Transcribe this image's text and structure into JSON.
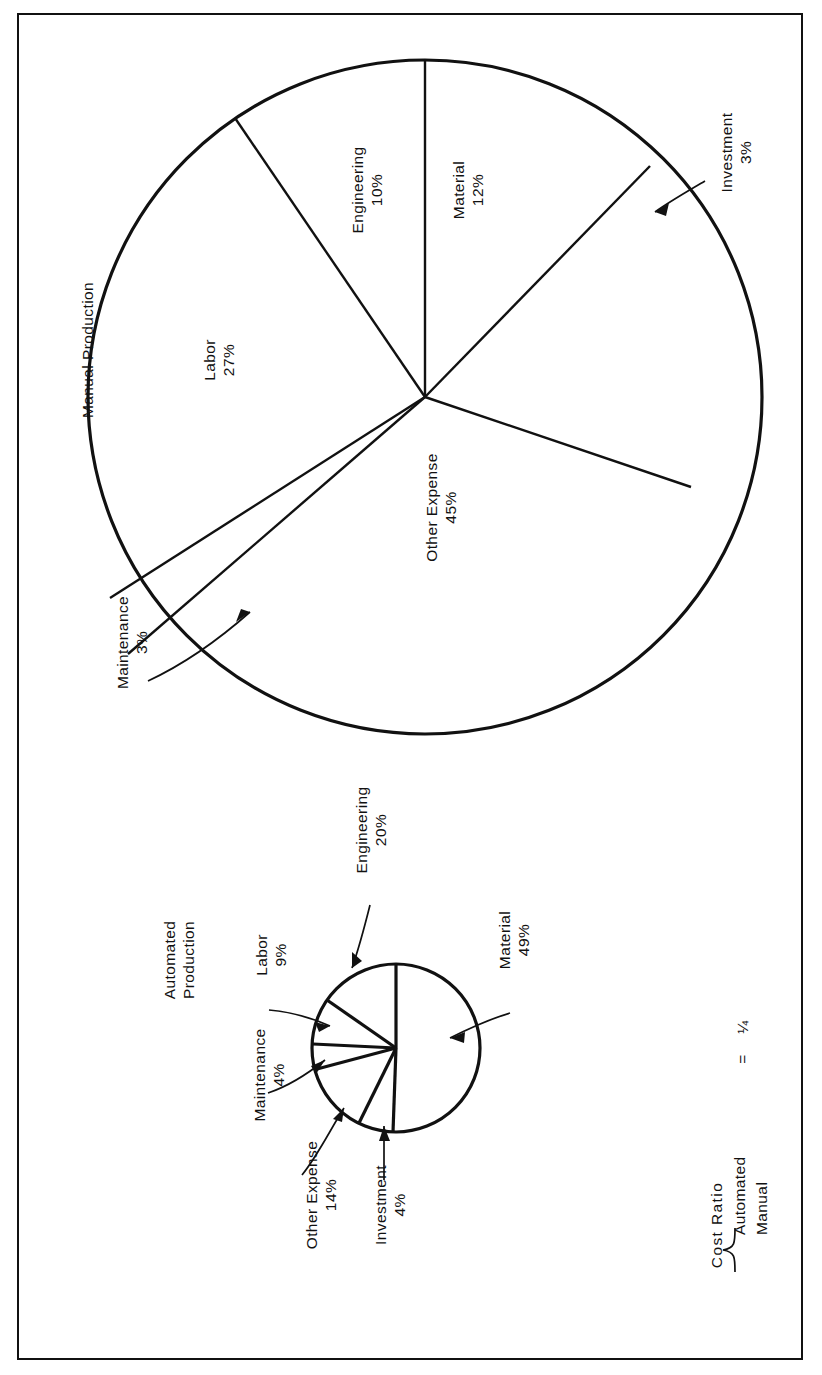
{
  "figure": {
    "orientation": "rotated-90-ccw",
    "border_color": "#111111",
    "background": "#ffffff"
  },
  "manual": {
    "title": "Manual Production",
    "labels": {
      "engineering": "Engineering\n10%",
      "material": "Material\n12%",
      "investment": "Investment\n3%",
      "other_expense": "Other Expense\n45%",
      "maintenance": "Maintenance\n3%",
      "labor": "Labor\n27%"
    }
  },
  "automated": {
    "title": "Automated\nProduction",
    "labels": {
      "engineering": "Engineering\n20%",
      "labor": "Labor\n9%",
      "maintenance": "Maintenance\n4%",
      "other_expense": "Other Expense\n14%",
      "investment": "Investment\n4%",
      "material": "Material\n49%"
    }
  },
  "cost_ratio": {
    "label": "Cost Ratio",
    "numerator": "Automated",
    "denominator": "Manual",
    "equals": "=",
    "value": "¼"
  },
  "chart_data": [
    {
      "type": "pie",
      "title": "Manual Production",
      "categories": [
        "Material",
        "Investment",
        "Other Expense",
        "Maintenance",
        "Labor",
        "Engineering"
      ],
      "values": [
        12,
        3,
        45,
        3,
        27,
        10
      ],
      "unit": "%",
      "labels": [
        "Material 12%",
        "Investment 3%",
        "Other Expense 45%",
        "Maintenance 3%",
        "Labor 27%",
        "Engineering 10%"
      ],
      "legend": "none",
      "note": "Large pie; slices labeled in place or via leader-line arrows"
    },
    {
      "type": "pie",
      "title": "Automated Production",
      "categories": [
        "Material",
        "Investment",
        "Other Expense",
        "Maintenance",
        "Labor",
        "Engineering"
      ],
      "values": [
        49,
        4,
        14,
        4,
        9,
        20
      ],
      "unit": "%",
      "labels": [
        "Material 49%",
        "Investment 4%",
        "Other Expense 14%",
        "Maintenance 4%",
        "Labor 9%",
        "Engineering 20%"
      ],
      "legend": "none",
      "note": "Small pie, drawn at 1/4 linear scale of the manual pie; Cost Ratio Automated/Manual = 1/4"
    }
  ]
}
